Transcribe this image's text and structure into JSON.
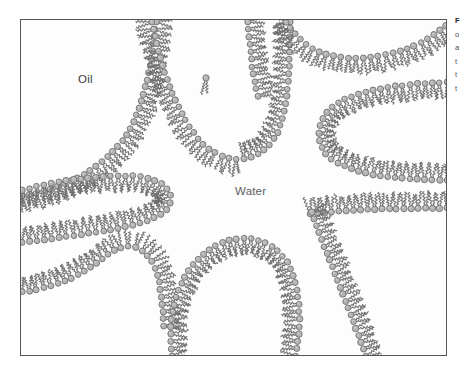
{
  "figure": {
    "type": "bicontinuous-microemulsion",
    "width": 468,
    "height": 370,
    "frame": {
      "x": 20,
      "y": 19,
      "width": 427,
      "height": 337
    },
    "background_color": "#fdfdfd",
    "frame_color": "#555558"
  },
  "labels": {
    "oil": "Oil",
    "water": "Water"
  },
  "caption": {
    "lines": [
      "F",
      "o",
      "a",
      "t",
      "t",
      "t"
    ]
  },
  "style": {
    "head_fill": "#b4b4b4",
    "head_stroke": "#6f6f72",
    "head_highlight": "#d8d8d8",
    "tail_stroke": "#6a6a6d",
    "head_radius": 3.0,
    "tail_length": 13.5,
    "tail_spread": 2.2,
    "tail_wave_amplitude": 1.15,
    "tail_wave_count": 4.5,
    "spacing": 7.4
  },
  "chart_data": {
    "type": "diagram",
    "phases": [
      {
        "name": "Oil",
        "label_position": [
          88,
          80
        ],
        "side": "tails"
      },
      {
        "name": "Water",
        "label_position": [
          255,
          192
        ],
        "side": "heads"
      }
    ],
    "interfaces": [
      {
        "name": "top-left-arc",
        "path": "M 22 196 C 56 190 92 176 118 146 C 142 118 150 76 156 22",
        "head_side": "right",
        "closed": false
      },
      {
        "name": "top-center-hairpin",
        "path": "M 152 22 C 160 62 172 104 196 136 C 214 160 244 166 264 150 C 286 132 290 96 290 22",
        "head_side": "left",
        "closed": false
      },
      {
        "name": "top-center-right-wall",
        "path": "M 248 22 C 250 48 252 74 258 96",
        "head_side": "right",
        "closed": false
      },
      {
        "name": "top-right-arc",
        "path": "M 286 22 C 300 44 320 58 352 58 C 392 58 420 46 446 26",
        "head_side": "bottom",
        "closed": false
      },
      {
        "name": "right-middle-hairpin",
        "path": "M 447 82 C 412 84 376 86 348 98 C 318 110 310 140 330 158 C 352 176 406 180 447 180",
        "head_side": "outside",
        "closed": false
      },
      {
        "name": "left-finger",
        "path": "M 22 190 C 56 182 96 174 134 176 C 166 178 178 196 166 210 C 152 224 112 230 70 236 C 50 239 34 241 22 242",
        "head_side": "outside",
        "closed": false
      },
      {
        "name": "bottom-left-arc",
        "path": "M 22 292 C 52 288 78 278 98 262 C 116 248 128 240 144 252 C 158 263 162 290 164 326",
        "head_side": "top",
        "closed": false
      },
      {
        "name": "bottom-center-dome",
        "path": "M 172 356 C 166 312 180 268 212 248 C 244 228 280 240 292 272 C 302 300 300 330 296 356",
        "head_side": "outside",
        "closed": false
      },
      {
        "name": "bottom-right-wedge",
        "path": "M 310 214 C 346 210 396 208 447 208",
        "head_side": "top",
        "closed": false
      },
      {
        "name": "bottom-right-edge",
        "path": "M 312 212 C 324 248 346 300 366 356",
        "head_side": "right",
        "closed": false
      }
    ],
    "free_molecule": {
      "name": "isolated-amphiphile",
      "position": [
        206,
        78
      ],
      "angle": 95
    }
  }
}
